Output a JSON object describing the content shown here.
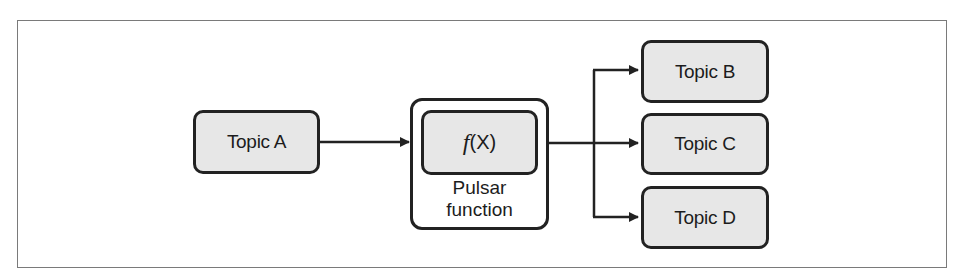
{
  "diagram": {
    "source": {
      "label": "Topic A"
    },
    "function": {
      "symbol": "f",
      "arg": "(X)",
      "label_line1": "Pulsar",
      "label_line2": "function"
    },
    "targets": [
      {
        "label": "Topic B"
      },
      {
        "label": "Topic C"
      },
      {
        "label": "Topic D"
      }
    ],
    "edges": [
      {
        "from": "Topic A",
        "to": "Pulsar function"
      },
      {
        "from": "Pulsar function",
        "to": "Topic B"
      },
      {
        "from": "Pulsar function",
        "to": "Topic C"
      },
      {
        "from": "Pulsar function",
        "to": "Topic D"
      }
    ],
    "colors": {
      "node_fill": "#e7e7e7",
      "stroke": "#222222",
      "frame": "#7a7a7a"
    }
  }
}
